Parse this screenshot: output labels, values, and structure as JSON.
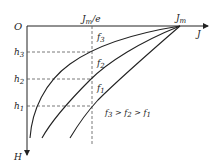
{
  "diagram": {
    "origin_label": "O",
    "x_axis_label": "J",
    "y_axis_label": "H",
    "jm_label": "J",
    "jm_sub": "m",
    "jme_label": "J",
    "jme_sub": "m",
    "jme_suffix": "/e",
    "h_labels": [
      {
        "main": "h",
        "sub": "3"
      },
      {
        "main": "h",
        "sub": "2"
      },
      {
        "main": "h",
        "sub": "1"
      }
    ],
    "curve_labels": [
      {
        "main": "f",
        "sub": "3"
      },
      {
        "main": "f",
        "sub": "2"
      },
      {
        "main": "f",
        "sub": "1"
      }
    ],
    "relation": {
      "parts": [
        "f",
        "3",
        " > ",
        "f",
        "2",
        " > ",
        "f",
        "1"
      ]
    },
    "colors": {
      "line": "#222222",
      "dash": "#555555"
    }
  }
}
